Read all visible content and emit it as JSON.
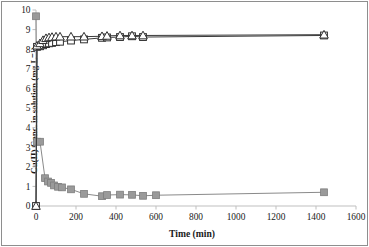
{
  "chart_data": {
    "type": "line",
    "title": "",
    "subtitle": "",
    "xlabel": "Time (min)",
    "ylabel": "Cu(II) Conc. in solution (mg L⁻¹)",
    "xlim": [
      0,
      1600
    ],
    "ylim": [
      0,
      10
    ],
    "xticks": [
      0,
      200,
      400,
      600,
      800,
      1000,
      1200,
      1400,
      1600
    ],
    "yticks": [
      0,
      1,
      2,
      3,
      4,
      5,
      6,
      7,
      8,
      9,
      10
    ],
    "xtick_labels": [
      "0",
      "200",
      "400",
      "600",
      "800",
      "1000",
      "1200",
      "1400",
      "1600"
    ],
    "ytick_labels": [
      "0",
      "1",
      "2",
      "3",
      "4",
      "5",
      "6",
      "7",
      "8",
      "9",
      "10"
    ],
    "grid": false,
    "legend": "none",
    "series": [
      {
        "name": "Cu(II) remaining in solution",
        "marker": "filled-square",
        "marker_color": "#9a9a9a",
        "line_color": "#8a8a8a",
        "x": [
          0,
          5,
          20,
          45,
          60,
          75,
          90,
          110,
          130,
          175,
          240,
          330,
          355,
          420,
          480,
          535,
          600,
          1440
        ],
        "y": [
          9.68,
          3.28,
          3.28,
          1.42,
          1.25,
          1.18,
          1.05,
          0.98,
          0.95,
          0.85,
          0.62,
          0.5,
          0.56,
          0.58,
          0.57,
          0.52,
          0.55,
          0.7
        ]
      },
      {
        "name": "Cu(II) sorbed - replicate 1",
        "marker": "open-square",
        "marker_color": "#ffffff",
        "line_color": "#3a3a3a",
        "x": [
          0,
          5,
          20,
          35,
          50,
          65,
          80,
          100,
          120,
          175,
          240,
          330,
          355,
          420,
          480,
          535,
          1440
        ],
        "y": [
          0.0,
          8.12,
          8.15,
          8.2,
          8.26,
          8.3,
          8.32,
          8.36,
          8.38,
          8.44,
          8.5,
          8.58,
          8.6,
          8.62,
          8.66,
          8.62,
          8.7
        ]
      },
      {
        "name": "Cu(II) sorbed - replicate 2",
        "marker": "open-triangle",
        "marker_color": "#ffffff",
        "line_color": "#3a3a3a",
        "x": [
          0,
          5,
          20,
          35,
          50,
          65,
          80,
          100,
          120,
          175,
          240,
          330,
          355,
          420,
          480,
          535,
          1440
        ],
        "y": [
          0.0,
          8.18,
          8.3,
          8.46,
          8.56,
          8.6,
          8.62,
          8.64,
          8.64,
          8.64,
          8.64,
          8.66,
          8.68,
          8.7,
          8.7,
          8.7,
          8.74
        ]
      }
    ],
    "axis_color": "#bfbfbf",
    "text_color": "#1a1a1a",
    "background": "#ffffff"
  }
}
